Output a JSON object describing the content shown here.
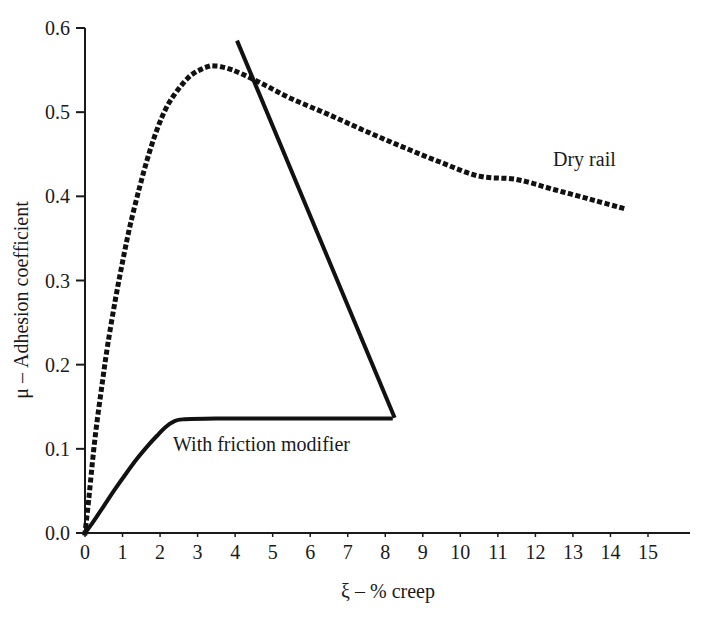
{
  "chart_data": {
    "type": "line",
    "title": "",
    "subtitle": "",
    "xlabel": "ξ – % creep",
    "ylabel": "μ – Adhesion coefficient",
    "xlim": [
      0,
      15
    ],
    "ylim": [
      0.0,
      0.6
    ],
    "xticks": [
      "0",
      "1",
      "2",
      "3",
      "4",
      "5",
      "6",
      "7",
      "8",
      "9",
      "10",
      "11",
      "12",
      "13",
      "14",
      "15"
    ],
    "xtick_values": [
      0,
      1,
      2,
      3,
      4,
      5,
      6,
      7,
      8,
      9,
      10,
      11,
      12,
      13,
      14,
      15
    ],
    "yticks": [
      "0.0",
      "0.1",
      "0.2",
      "0.3",
      "0.4",
      "0.5",
      "0.6"
    ],
    "ytick_values": [
      0.0,
      0.1,
      0.2,
      0.3,
      0.4,
      0.5,
      0.6
    ],
    "grid": false,
    "legend_position": "inline-annotations",
    "series": [
      {
        "name": "Dry rail",
        "style": "dotted",
        "color": "#111111",
        "annotation": "Dry rail",
        "annotation_x": 11.6,
        "annotation_y": 0.455,
        "points": [
          [
            0.0,
            0.0
          ],
          [
            0.1,
            0.04
          ],
          [
            0.2,
            0.085
          ],
          [
            0.3,
            0.125
          ],
          [
            0.45,
            0.175
          ],
          [
            0.6,
            0.222
          ],
          [
            0.8,
            0.275
          ],
          [
            1.0,
            0.322
          ],
          [
            1.2,
            0.365
          ],
          [
            1.45,
            0.41
          ],
          [
            1.7,
            0.45
          ],
          [
            1.95,
            0.483
          ],
          [
            2.2,
            0.508
          ],
          [
            2.5,
            0.528
          ],
          [
            2.8,
            0.543
          ],
          [
            3.1,
            0.551
          ],
          [
            3.4,
            0.555
          ],
          [
            3.8,
            0.552
          ],
          [
            4.2,
            0.545
          ],
          [
            4.8,
            0.532
          ],
          [
            5.5,
            0.516
          ],
          [
            6.5,
            0.497
          ],
          [
            7.5,
            0.477
          ],
          [
            8.5,
            0.458
          ],
          [
            9.5,
            0.44
          ],
          [
            10.5,
            0.424
          ],
          [
            11.5,
            0.42
          ],
          [
            12.5,
            0.408
          ],
          [
            13.5,
            0.396
          ],
          [
            14.4,
            0.385
          ]
        ]
      },
      {
        "name": "With friction modifier",
        "style": "solid",
        "color": "#111111",
        "annotation": "With friction modifier",
        "annotation_x": 2.6,
        "annotation_y": 0.113,
        "points": [
          [
            0.0,
            0.0
          ],
          [
            0.2,
            0.012
          ],
          [
            0.5,
            0.032
          ],
          [
            0.8,
            0.052
          ],
          [
            1.1,
            0.071
          ],
          [
            1.4,
            0.089
          ],
          [
            1.7,
            0.105
          ],
          [
            1.95,
            0.117
          ],
          [
            2.15,
            0.126
          ],
          [
            2.35,
            0.132
          ],
          [
            2.6,
            0.135
          ],
          [
            3.5,
            0.136
          ],
          [
            5.0,
            0.136
          ],
          [
            6.5,
            0.136
          ],
          [
            8.2,
            0.136
          ]
        ]
      },
      {
        "name": "Adhesion drop line",
        "style": "solid",
        "color": "#111111",
        "annotation": "",
        "points": [
          [
            4.05,
            0.585
          ],
          [
            8.25,
            0.137
          ]
        ]
      }
    ],
    "annotations": [
      {
        "text": "Dry rail",
        "x": 11.6,
        "y": 0.455
      },
      {
        "text": "With friction modifier",
        "x": 2.6,
        "y": 0.113
      }
    ]
  },
  "axes": {
    "x_axis_label": "ξ – % creep",
    "y_axis_label": "μ – Adhesion coefficient"
  },
  "labels": {
    "dry_rail": "Dry rail",
    "with_friction_modifier": "With friction modifier"
  }
}
